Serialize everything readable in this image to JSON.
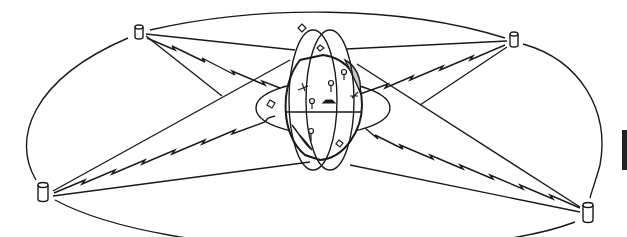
{
  "diagram": {
    "type": "satellite-communication-network",
    "colors": {
      "ink": "#1a1a1a",
      "background": "#ffffff",
      "land_shade": "#c8c8c8"
    },
    "nodes": [
      {
        "id": "node-top-left",
        "kind": "cylinder",
        "x": 139,
        "y": 33
      },
      {
        "id": "node-top-right",
        "kind": "cylinder",
        "x": 514,
        "y": 40
      },
      {
        "id": "node-left",
        "kind": "cylinder",
        "x": 44,
        "y": 193
      },
      {
        "id": "node-right",
        "kind": "cylinder",
        "x": 588,
        "y": 213
      }
    ],
    "globe": {
      "cx": 323,
      "cy": 105,
      "rx": 40,
      "ry": 56
    },
    "orbit_ring": {
      "cx": 313,
      "cy": 120,
      "rx": 291,
      "ry": 107
    }
  }
}
